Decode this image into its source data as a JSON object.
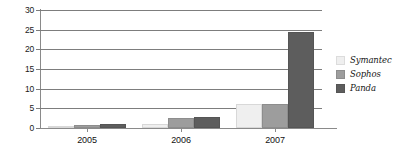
{
  "chart_data": {
    "type": "bar",
    "title": "",
    "xlabel": "",
    "ylabel": "",
    "categories": [
      "2005",
      "2006",
      "2007"
    ],
    "series": [
      {
        "name": "Symantec",
        "color": "#efefef",
        "values": [
          0.3,
          1.1,
          6.2
        ]
      },
      {
        "name": "Sophos",
        "color": "#9d9d9d",
        "values": [
          0.7,
          2.6,
          6.2
        ]
      },
      {
        "name": "Panda",
        "color": "#5d5d5d",
        "values": [
          0.9,
          2.9,
          24.3
        ]
      }
    ],
    "ylim": [
      0,
      30
    ],
    "ytick_labels": [
      "0",
      "5",
      "10",
      "15",
      "20",
      "25",
      "30"
    ],
    "ytick_values": [
      0,
      5,
      10,
      15,
      20,
      25,
      30
    ],
    "grid": true,
    "grid_axis": "y",
    "legend_position": "right",
    "legend": [
      "Symantec",
      "Sophos",
      "Panda"
    ]
  },
  "axis": {
    "y": {
      "t0": "0",
      "t5": "5",
      "t10": "10",
      "t15": "15",
      "t20": "20",
      "t25": "25",
      "t30": "30"
    },
    "x": {
      "c0": "2005",
      "c1": "2006",
      "c2": "2007"
    }
  },
  "legend": {
    "items": [
      {
        "label": "Symantec"
      },
      {
        "label": "Sophos"
      },
      {
        "label": "Panda"
      }
    ]
  }
}
